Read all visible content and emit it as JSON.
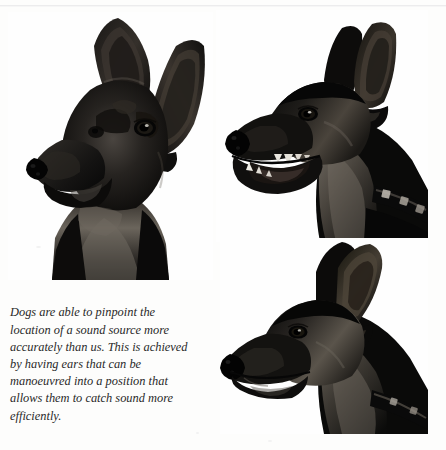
{
  "page": {
    "running_head": "THE SENSE OF HEARING",
    "background_color": "#fdfdfc",
    "rule_color": "#ececed",
    "width": 446,
    "height": 450
  },
  "caption": {
    "text": "Dogs are able to pinpoint the location of a sound source more accurately than us. This is achieved by having ears that can be manoeuvred into a position that allows them to catch sound more efficiently.",
    "style": "italic-serif",
    "color": "#2a2a2a"
  },
  "photos": [
    {
      "id": "photo-front",
      "name": "dog-head-front-view",
      "subject": "black Manchester Terrier / Doberman head, front three-quarter view",
      "ear_position": "both ears erect and pricked forward",
      "alt": "Front view of a black dog with tall erect ears, pale tan muzzle shading and chest"
    },
    {
      "id": "photo-side",
      "name": "dog-head-side-view-panting",
      "subject": "same dog in left-facing profile with open mouth",
      "ear_position": "ears erect, angled slightly back",
      "details": "mouth open showing teeth and tongue, studded leather collar visible at lower right",
      "alt": "Side profile of a black dog panting with mouth open, wearing a collar"
    },
    {
      "id": "photo-back",
      "name": "dog-head-ears-back-view",
      "subject": "same dog in left-facing profile, mouth closed",
      "ear_position": "ears swivelled backwards and flattened",
      "details": "collar strap visible at lower right",
      "alt": "Side profile of a black dog with ears swivelled back"
    }
  ],
  "colors": {
    "fur_dark": "#111111",
    "fur_mid": "#3a3a3a",
    "fur_highlight": "#6e6a63",
    "tan_shade": "#8a8078",
    "background": "#fdfdfc"
  }
}
